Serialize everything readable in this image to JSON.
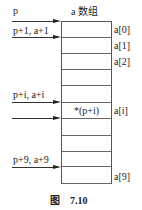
{
  "header": {
    "array_title": "a 数组"
  },
  "pointers": [
    {
      "label": "p",
      "y": 21,
      "label_y": 6
    },
    {
      "label": "p+1, a+1",
      "y": 37,
      "label_y": 26
    },
    {
      "label": "p+i, a+i",
      "y": 102,
      "label_y": 90
    },
    {
      "label": "",
      "y": 118,
      "label_y": 0
    },
    {
      "label": "p+9, a+9",
      "y": 167,
      "label_y": 155
    }
  ],
  "cells": [
    {
      "content": "",
      "index_label": "a[0]"
    },
    {
      "content": "",
      "index_label": "a[1]"
    },
    {
      "content": "",
      "index_label": "a[2]"
    },
    {
      "content": "",
      "index_label": ""
    },
    {
      "content": "",
      "index_label": ""
    },
    {
      "content": "*(p+i)",
      "index_label": "a[i]"
    },
    {
      "content": "",
      "index_label": ""
    },
    {
      "content": "",
      "index_label": ""
    },
    {
      "content": "",
      "index_label": ""
    },
    {
      "content": "",
      "index_label": "a[9]"
    }
  ],
  "caption": {
    "prefix": "图",
    "number": "7.10"
  }
}
